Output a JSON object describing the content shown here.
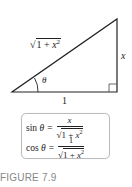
{
  "diagram": {
    "hypotenuse_label": {
      "radical": "√",
      "radicand_prefix": "1 + ",
      "var": "x",
      "exp": "2"
    },
    "opposite_label": "x",
    "adjacent_label": "1",
    "angle_label": "θ",
    "stroke_color": "#222222"
  },
  "formulas": {
    "sin": {
      "fn": "sin",
      "var": "θ",
      "eq": "=",
      "numerator": "x",
      "den_radical": "√",
      "den_prefix": "1 + ",
      "den_var": "x",
      "den_exp": "2"
    },
    "cos": {
      "fn": "cos",
      "var": "θ",
      "eq": "=",
      "numerator": "1",
      "den_radical": "√",
      "den_prefix": "1 + ",
      "den_var": "x",
      "den_exp": "2"
    },
    "box_border_color": "#bbbbbb"
  },
  "caption": {
    "text": "FIGURE 7.9",
    "color": "#888888"
  }
}
